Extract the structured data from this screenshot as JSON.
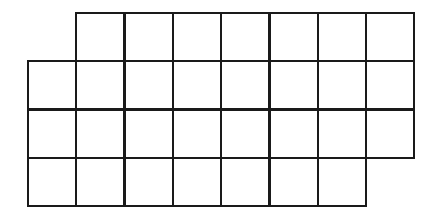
{
  "diagram": {
    "type": "grid-shape",
    "cell_size": 48.3,
    "origin_x": 28,
    "origin_y": 13,
    "line_color": "#1a1a1a",
    "background": "#ffffff",
    "rows": [
      {
        "row": 1,
        "start_col": 2,
        "end_col": 8,
        "cells": 7
      },
      {
        "row": 2,
        "start_col": 1,
        "end_col": 8,
        "cells": 8
      },
      {
        "row": 3,
        "start_col": 1,
        "end_col": 8,
        "cells": 8
      },
      {
        "row": 4,
        "start_col": 1,
        "end_col": 7,
        "cells": 7
      }
    ],
    "total_cells": 30
  }
}
